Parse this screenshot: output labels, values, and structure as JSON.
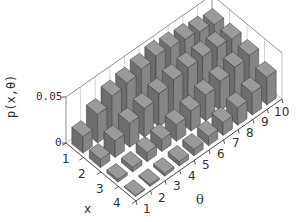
{
  "chart_data": {
    "type": "bar3d",
    "title": "",
    "xlabel": "x",
    "ylabel": "θ",
    "zlabel": "p(x,θ)",
    "x_ticks": [
      "1",
      "2",
      "3",
      "4"
    ],
    "y_ticks": [
      "1",
      "2",
      "3",
      "4",
      "5",
      "6",
      "7",
      "8",
      "9",
      "10"
    ],
    "z_ticks": [
      "0",
      "0.05"
    ],
    "zlim": [
      0,
      0.05
    ],
    "grid": false,
    "bar_color": "#7a7a7a",
    "x": [
      1,
      2,
      3,
      4
    ],
    "theta": [
      1,
      2,
      3,
      4,
      5,
      6,
      7,
      8,
      9,
      10
    ],
    "values": [
      [
        0.018,
        0.031,
        0.04,
        0.043,
        0.047,
        0.05,
        0.048,
        0.046,
        0.043,
        0.04
      ],
      [
        0.009,
        0.018,
        0.026,
        0.031,
        0.036,
        0.04,
        0.042,
        0.043,
        0.042,
        0.04
      ],
      [
        0.003,
        0.005,
        0.01,
        0.013,
        0.018,
        0.022,
        0.028,
        0.032,
        0.036,
        0.038
      ],
      [
        0.001,
        0.002,
        0.003,
        0.005,
        0.007,
        0.01,
        0.014,
        0.019,
        0.024,
        0.03
      ]
    ]
  },
  "labels": {
    "zlabel": "p(x,θ)",
    "z0": "0",
    "z1": "0.05",
    "xlabel": "x",
    "ylabel": "θ",
    "x1": "1",
    "x2": "2",
    "x3": "3",
    "x4": "4",
    "t1": "1",
    "t2": "2",
    "t3": "3",
    "t4": "4",
    "t5": "5",
    "t6": "6",
    "t7": "7",
    "t8": "8",
    "t9": "9",
    "t10": "10"
  }
}
